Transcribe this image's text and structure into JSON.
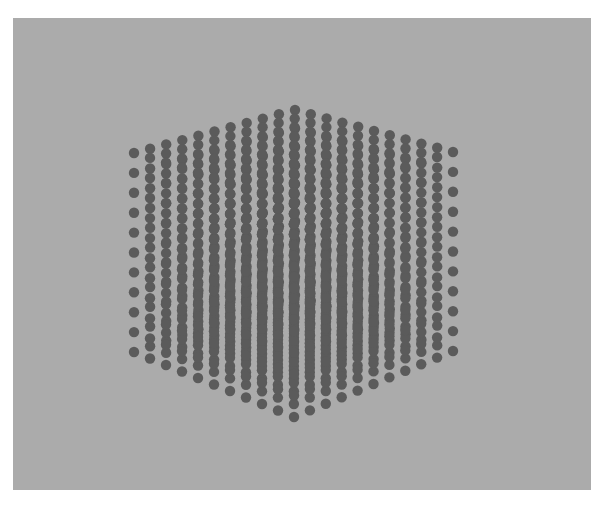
{
  "scene": {
    "description": "Rendered 3D cubic lattice of dots on a gray background",
    "background_color": "#ffffff",
    "panel_color": "#ababab",
    "dot_color": "#5b5b5b",
    "panel": {
      "x": 13,
      "y": 18,
      "width": 578,
      "height": 472
    }
  },
  "lattice": {
    "points_per_edge": 11,
    "dot_radius": 5.2,
    "projection": {
      "center_x": 294,
      "yaw_deg": 45,
      "anchors": {
        "top_apex": [
          295,
          110
        ],
        "left_top": [
          134,
          153
        ],
        "right_top": [
          453,
          152
        ],
        "left_bottom": [
          134,
          352
        ],
        "right_bottom": [
          453,
          351
        ],
        "bottom_apex": [
          294,
          417
        ]
      }
    }
  }
}
